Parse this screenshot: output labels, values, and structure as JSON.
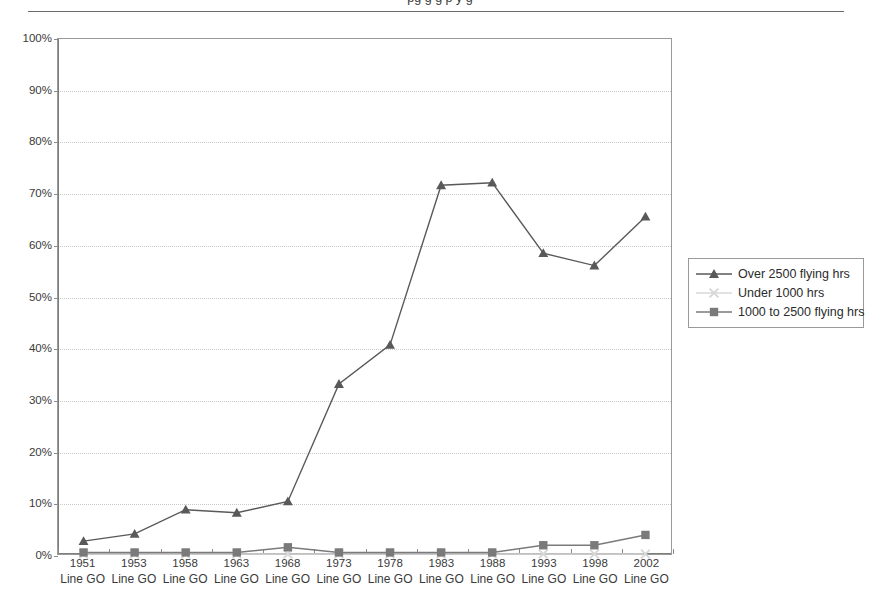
{
  "header": {
    "clipped_title": "pg          g g p y       g",
    "rule": "horizontal-rule"
  },
  "legend": {
    "position": "right",
    "items": [
      {
        "label": "Over 2500 flying hrs",
        "marker": "triangle",
        "color": "#595959"
      },
      {
        "label": "Under 1000 hrs",
        "marker": "x-cross",
        "color": "#d8d8d8"
      },
      {
        "label": "1000 to 2500 flying hrs",
        "marker": "square",
        "color": "#7a7a7a"
      }
    ]
  },
  "axes": {
    "y_ticks": [
      "0%",
      "10%",
      "20%",
      "30%",
      "40%",
      "50%",
      "60%",
      "70%",
      "80%",
      "90%",
      "100%"
    ],
    "x_sub_label": "Line GO"
  },
  "chart_data": {
    "type": "line",
    "title": "",
    "subtitle": "",
    "xlabel": "",
    "ylabel": "",
    "ylim": [
      0,
      100
    ],
    "ytick_step": 10,
    "ytick_format": "percent",
    "grid": true,
    "legend_position": "right",
    "categories": [
      "1951",
      "1953",
      "1958",
      "1963",
      "1968",
      "1973",
      "1978",
      "1983",
      "1988",
      "1993",
      "1998",
      "2002"
    ],
    "category_sublabels": [
      "Line GO",
      "Line GO",
      "Line GO",
      "Line GO",
      "Line GO",
      "Line GO",
      "Line GO",
      "Line GO",
      "Line GO",
      "Line GO",
      "Line GO",
      "Line GO"
    ],
    "series": [
      {
        "name": "Over 2500 flying hrs",
        "marker": "triangle",
        "color": "#595959",
        "values": [
          2.5,
          3.9,
          8.6,
          8.0,
          10.2,
          33.0,
          40.6,
          71.6,
          72.1,
          58.4,
          56.0,
          65.5
        ]
      },
      {
        "name": "Under 1000 hrs",
        "marker": "x-cross",
        "color": "#d8d8d8",
        "values": [
          0.0,
          0.0,
          0.0,
          0.0,
          0.0,
          0.0,
          0.0,
          0.0,
          0.0,
          0.0,
          0.0,
          0.0
        ]
      },
      {
        "name": "1000 to 2500 flying hrs",
        "marker": "square",
        "color": "#7a7a7a",
        "values": [
          0.3,
          0.3,
          0.3,
          0.3,
          1.3,
          0.3,
          0.3,
          0.3,
          0.3,
          1.7,
          1.7,
          3.7
        ]
      }
    ]
  }
}
